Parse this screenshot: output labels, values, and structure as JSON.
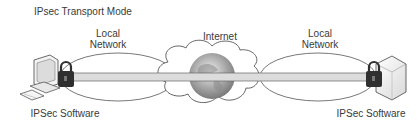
{
  "title": "IPsec Transport Mode",
  "labels": {
    "local_network_left": "Local\nNetwork",
    "internet": "Internet",
    "local_network_right": "Local\nNetwork",
    "software_left": "IPSec Software",
    "software_right": "IPSec Software"
  },
  "nodes": [
    {
      "id": "client",
      "type": "desktop-computer",
      "label": "IPSec Software"
    },
    {
      "id": "lan-left",
      "type": "ellipse",
      "label": "Local Network"
    },
    {
      "id": "internet",
      "type": "cloud-globe",
      "label": "Internet"
    },
    {
      "id": "lan-right",
      "type": "ellipse",
      "label": "Local Network"
    },
    {
      "id": "server",
      "type": "server",
      "label": "IPSec Software"
    }
  ],
  "edges": [
    {
      "from": "client",
      "to": "server",
      "type": "tunnel",
      "note": "end-to-end IPsec transport"
    }
  ],
  "colors": {
    "tunnel_fill": "#dcdcdc",
    "outline": "#555555",
    "lock": "#2f2f2f"
  }
}
